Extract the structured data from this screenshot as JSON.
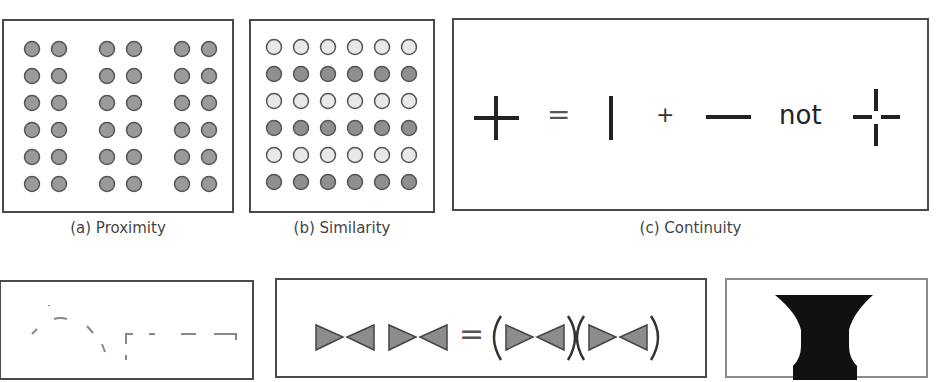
{
  "figure": {
    "panels": [
      {
        "id": "a",
        "caption": "(a) Proximity",
        "principle": "proximity",
        "grid": {
          "rows": 6,
          "columns_per_group": 2,
          "groups": 3,
          "dot_color": "#9a9a9a"
        }
      },
      {
        "id": "b",
        "caption": "(b) Similarity",
        "principle": "similarity",
        "grid": {
          "rows": 6,
          "columns": 6,
          "row_colors": [
            "#e8e8e8",
            "#8f8f8f",
            "#e8e8e8",
            "#8f8f8f",
            "#e8e8e8",
            "#8f8f8f"
          ]
        }
      },
      {
        "id": "c",
        "caption": "(c) Continuity",
        "principle": "continuity",
        "equation": {
          "equals": "=",
          "plus": "+",
          "not": "not"
        }
      },
      {
        "id": "d",
        "caption": "",
        "principle": "closure"
      },
      {
        "id": "e",
        "caption": "",
        "principle": "symmetry",
        "equation": {
          "equals": "="
        }
      },
      {
        "id": "f",
        "caption": "",
        "principle": "figure-ground"
      }
    ]
  },
  "colors": {
    "border": "#4a4a4a",
    "stroke": "#222222",
    "dot_dark": "#8f8f8f",
    "dot_light": "#e8e8e8",
    "triangle_fill": "#8c8c8c"
  }
}
